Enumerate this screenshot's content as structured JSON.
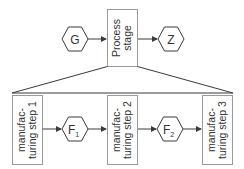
{
  "diagram": {
    "top": {
      "input": {
        "label": "G"
      },
      "process": {
        "line1": "Process",
        "line2": "stage"
      },
      "output": {
        "label": "Z"
      }
    },
    "bottom": {
      "steps": [
        {
          "line1": "manufac-",
          "line2": "turing step 1"
        },
        {
          "line1": "manufac-",
          "line2": "turing step 2"
        },
        {
          "line1": "manufac-",
          "line2": "turing step 3"
        }
      ],
      "intermediates": [
        {
          "label": "F",
          "subscript": "1"
        },
        {
          "label": "F",
          "subscript": "2"
        }
      ]
    },
    "colors": {
      "stroke": "#3a3a3a",
      "box_border": "#9a9a9a",
      "text": "#333333"
    }
  }
}
